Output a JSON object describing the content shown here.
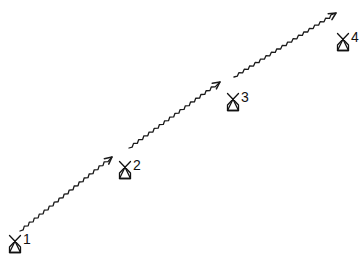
{
  "diagram": {
    "type": "sequence-of-points",
    "style": "hand-drawn",
    "stroke_color": "#1a1a1a",
    "background": "#ffffff",
    "nodes": [
      {
        "id": "x1",
        "symbol": "X-with-triangle-base",
        "index": "1",
        "x": 8,
        "y": 234
      },
      {
        "id": "x2",
        "symbol": "X-with-triangle-base",
        "index": "2",
        "x": 118,
        "y": 160
      },
      {
        "id": "x3",
        "symbol": "X-with-triangle-base",
        "index": "3",
        "x": 226,
        "y": 92
      },
      {
        "id": "x4",
        "symbol": "X-with-triangle-base",
        "index": "4",
        "x": 336,
        "y": 32
      }
    ],
    "edges": [
      {
        "from": "x1",
        "to": "x2",
        "style": "wavy-arrow",
        "x1": 20,
        "y1": 231,
        "x2": 112,
        "y2": 157
      },
      {
        "from": "x2",
        "to": "x3",
        "style": "wavy-arrow",
        "x1": 129,
        "y1": 148,
        "x2": 220,
        "y2": 82
      },
      {
        "from": "x3",
        "to": "x4",
        "style": "wavy-arrow",
        "x1": 234,
        "y1": 77,
        "x2": 336,
        "y2": 13
      }
    ]
  }
}
